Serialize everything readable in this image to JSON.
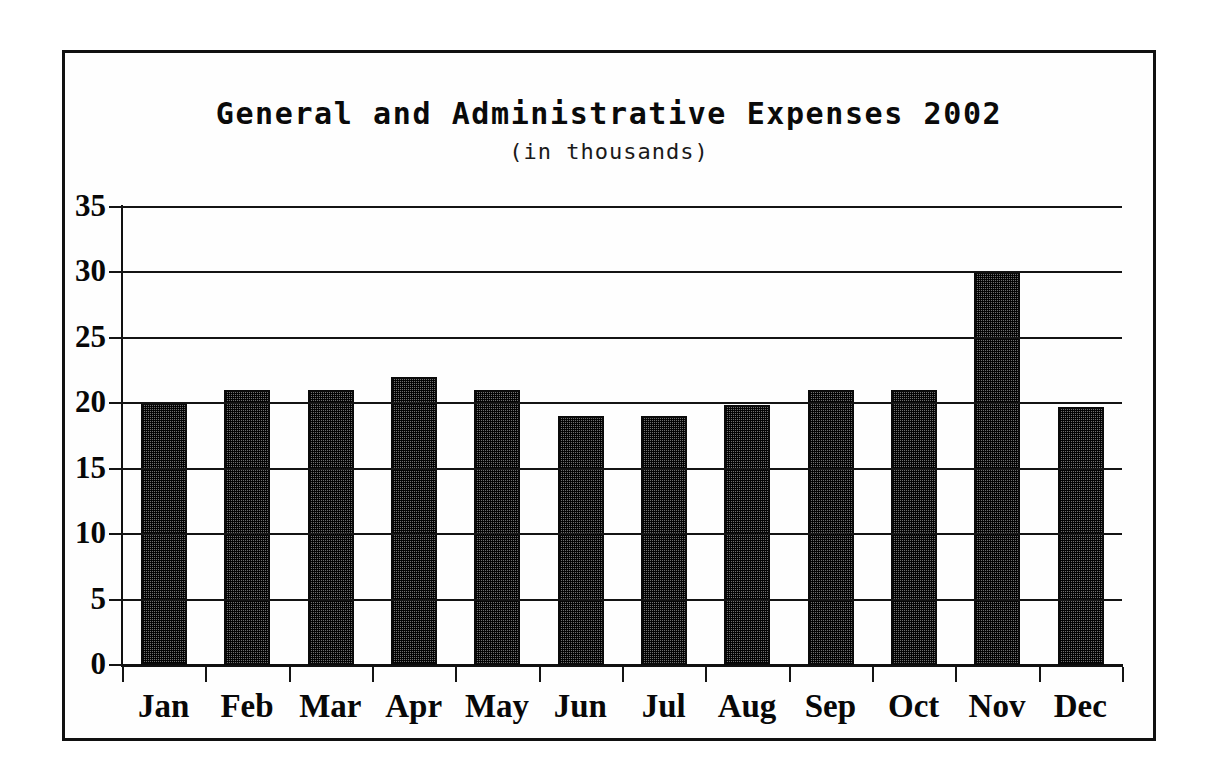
{
  "chart_data": {
    "type": "bar",
    "title": "General and Administrative Expenses 2002",
    "subtitle": "(in thousands)",
    "xlabel": "",
    "ylabel": "",
    "categories": [
      "Jan",
      "Feb",
      "Mar",
      "Apr",
      "May",
      "Jun",
      "Jul",
      "Aug",
      "Sep",
      "Oct",
      "Nov",
      "Dec"
    ],
    "values": [
      20,
      21,
      21,
      22,
      21,
      19,
      19,
      19.9,
      21,
      21,
      30,
      19.7
    ],
    "series": [
      {
        "name": "General and Administrative Expenses",
        "values": [
          20,
          21,
          21,
          22,
          21,
          19,
          19,
          19.9,
          21,
          21,
          30,
          19.7
        ]
      }
    ],
    "ylim": [
      0,
      35
    ],
    "ytick_labels": [
      "35",
      "30",
      "25",
      "20",
      "15",
      "10",
      "5",
      "0"
    ],
    "ytick_values": [
      35,
      30,
      25,
      20,
      15,
      10,
      5,
      0
    ],
    "grid": true,
    "legend": false,
    "bar_color": "#3b3b3b",
    "bar_outline_color": "#0a0a0a",
    "axis_color": "#141414",
    "background_color": "#ffffff"
  }
}
